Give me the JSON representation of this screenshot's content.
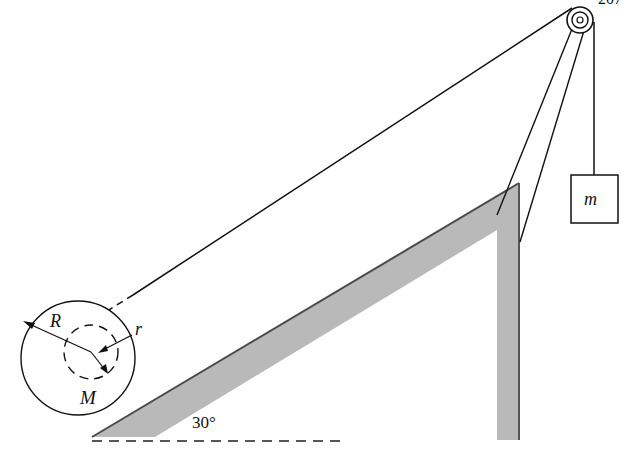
{
  "page": {
    "number": "207"
  },
  "diagram": {
    "labels": {
      "outer_radius": "R",
      "inner_radius": "r",
      "spool_mass": "M",
      "hanging_mass": "m",
      "incline_angle": "30°"
    },
    "colors": {
      "incline_fill": "#b8b8b8",
      "incline_edge": "#555555",
      "line": "#111111"
    }
  }
}
